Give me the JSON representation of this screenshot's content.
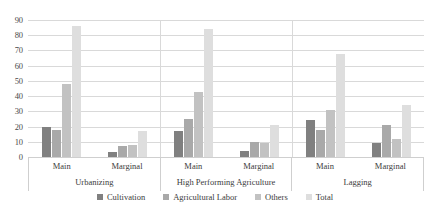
{
  "chart_data": {
    "type": "bar",
    "title": "",
    "xlabel": "",
    "ylabel": "",
    "ylim": [
      0,
      90
    ],
    "ytick_step": 10,
    "yticks": [
      90,
      80,
      70,
      60,
      50,
      40,
      30,
      20,
      10,
      0
    ],
    "grid": true,
    "legend_position": "bottom",
    "major_groups": [
      "Urbanizing",
      "High Performing Agriculture",
      "Lagging"
    ],
    "sub_categories": [
      "Main",
      "Marginal"
    ],
    "categories": [
      "Urbanizing - Main",
      "Urbanizing - Marginal",
      "High Performing Agriculture - Main",
      "High Performing Agriculture - Marginal",
      "Lagging - Main",
      "Lagging - Marginal"
    ],
    "series": [
      {
        "name": "Cultivation",
        "color": "#808080",
        "values": [
          20,
          3,
          17,
          4,
          24,
          9
        ]
      },
      {
        "name": "Agricultural Labor",
        "color": "#a9a9a9",
        "values": [
          18,
          7,
          25,
          10,
          18,
          21
        ]
      },
      {
        "name": "Others",
        "color": "#c2c2c2",
        "values": [
          48,
          8,
          43,
          9,
          31,
          12
        ]
      },
      {
        "name": "Total",
        "color": "#dedede",
        "values": [
          86,
          17,
          84,
          21,
          68,
          34
        ]
      }
    ]
  },
  "legend": {
    "items": [
      {
        "label": "Cultivation",
        "color": "#808080"
      },
      {
        "label": "Agricultural Labor",
        "color": "#a9a9a9"
      },
      {
        "label": "Others",
        "color": "#c2c2c2"
      },
      {
        "label": "Total",
        "color": "#dedede"
      }
    ]
  }
}
